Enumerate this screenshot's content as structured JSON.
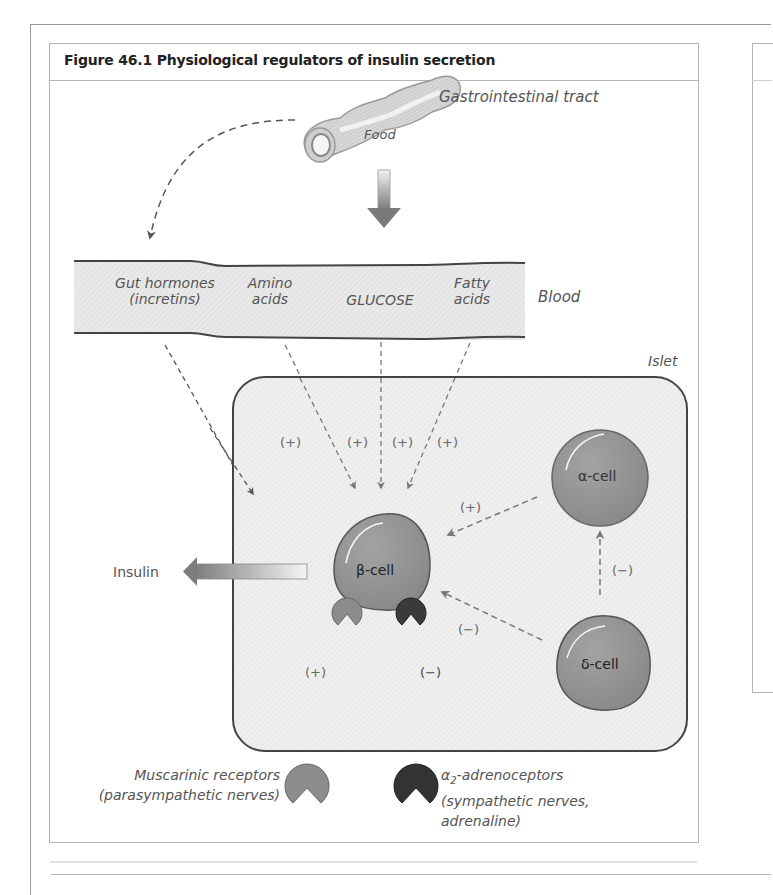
{
  "figure": {
    "title": "Figure 46.1   Physiological regulators of insulin secretion"
  },
  "gi_tract": {
    "label": "Gastrointestinal tract",
    "food_label": "Food"
  },
  "blood": {
    "label": "Blood",
    "components": [
      {
        "line1": "Gut hormones",
        "line2": "(incretins)"
      },
      {
        "line1": "Amino",
        "line2": "acids"
      },
      {
        "line1": "",
        "line2": "GLUCOSE"
      },
      {
        "line1": "Fatty",
        "line2": "acids"
      }
    ]
  },
  "islet": {
    "label": "Islet",
    "cells": {
      "beta": "β-cell",
      "alpha": "α-cell",
      "delta": "δ-cell"
    },
    "signs": {
      "gut_hormones": "(+)",
      "amino_acids": "(+)",
      "glucose": "(+)",
      "fatty_acids": "(+)",
      "alpha_to_beta": "(+)",
      "delta_to_beta": "(−)",
      "delta_to_alpha": "(−)",
      "muscarinic": "(+)",
      "adrenergic": "(−)"
    }
  },
  "output": {
    "insulin_label": "Insulin"
  },
  "legend": {
    "muscarinic": {
      "line1": "Muscarinic receptors",
      "line2": "(parasympathetic nerves)",
      "color": "#8c8c8c"
    },
    "adrenergic": {
      "line1_prefix": "α",
      "line1_sub": "2",
      "line1_suffix": "-adrenoceptors",
      "line2": "(sympathetic nerves,",
      "line3": "adrenaline)",
      "color": "#333333"
    }
  },
  "colors": {
    "cell_fill": "#8f8f8f",
    "blood_fill": "#ececec",
    "islet_fill": "#efefef",
    "outline": "#444444",
    "text": "#555555"
  }
}
